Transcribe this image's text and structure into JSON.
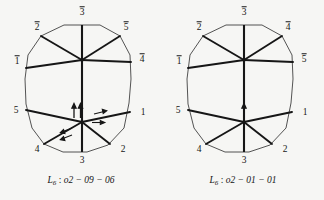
{
  "figure": {
    "type": "crystallographic-twin-diagrams",
    "background_color": "#f6f6f4",
    "line_color": "#161616",
    "panels": [
      {
        "id": "left",
        "caption": {
          "symbol": "L",
          "subscript": "6",
          "separator": " : ",
          "code": "o2 − 09 − 06",
          "full_text": "L6 : o2 - 09 - 06"
        },
        "vertex_labels": {
          "top": "3",
          "top_left": "2",
          "top_right": "5",
          "left_upper": "1",
          "right_upper": "4",
          "left_lower": "5",
          "right_lower": "1",
          "bottom_left": "4",
          "bottom_right": "2",
          "bottom": "3"
        },
        "overlined": {
          "top": true,
          "top_left": true,
          "top_right": true,
          "left_upper": true,
          "right_upper": true,
          "left_lower": false,
          "right_lower": false,
          "bottom_left": false,
          "bottom_right": false,
          "bottom": false
        },
        "arrows": [
          {
            "name": "arrow-up-left",
            "direction": "up",
            "count": 1
          },
          {
            "name": "arrow-up-right",
            "direction": "up",
            "count": 1
          },
          {
            "name": "arrow-right-upper",
            "direction": "right",
            "count": 1
          },
          {
            "name": "arrow-right-lower",
            "direction": "right",
            "count": 1
          },
          {
            "name": "arrow-downleft-upper",
            "direction": "down-left",
            "count": 1
          },
          {
            "name": "arrow-downleft-lower",
            "direction": "down-left",
            "count": 1
          }
        ],
        "arrow_count": 6
      },
      {
        "id": "right",
        "caption": {
          "symbol": "L",
          "subscript": "6",
          "separator": " : ",
          "code": "o2 − 01 − 01",
          "full_text": "L6 : o2 - 01 - 01"
        },
        "vertex_labels": {
          "top": "3",
          "top_left": "2",
          "top_right": "4",
          "left_upper": "1",
          "right_upper": "5",
          "left_lower": "5",
          "right_lower": "1",
          "bottom_left": "4",
          "bottom_right": "2",
          "bottom": "3"
        },
        "overlined": {
          "top": true,
          "top_left": true,
          "top_right": true,
          "left_upper": true,
          "right_upper": true,
          "left_lower": false,
          "right_lower": false,
          "bottom_left": false,
          "bottom_right": false,
          "bottom": false
        },
        "arrows": [
          {
            "name": "arrow-up-center",
            "direction": "up",
            "count": 1
          }
        ],
        "arrow_count": 1
      }
    ]
  }
}
